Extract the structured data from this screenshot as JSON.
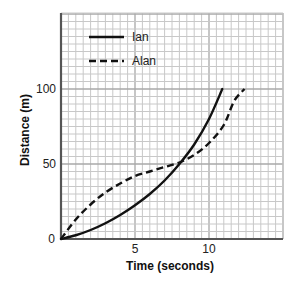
{
  "chart_data": {
    "type": "line",
    "title": "",
    "xlabel": "Time (seconds)",
    "ylabel": "Distance (m)",
    "xlim": [
      0,
      15
    ],
    "ylim": [
      0,
      150
    ],
    "x_ticks": [
      0,
      5,
      10
    ],
    "y_ticks": [
      50,
      100
    ],
    "origin_label": "0",
    "grid": true,
    "grid_minor": {
      "x_step": 0.5,
      "y_step": 5
    },
    "grid_major": {
      "x_step": 5,
      "y_step": 50
    },
    "legend_position": "upper-left-inside",
    "series": [
      {
        "name": "Ian",
        "style": "solid",
        "color": "#111111",
        "points": [
          [
            0,
            0
          ],
          [
            1,
            2.5
          ],
          [
            2,
            6
          ],
          [
            3,
            10.5
          ],
          [
            4,
            16
          ],
          [
            5,
            22.5
          ],
          [
            6,
            30
          ],
          [
            7,
            39
          ],
          [
            8,
            50
          ],
          [
            9,
            63
          ],
          [
            10,
            80
          ],
          [
            10.9,
            100
          ]
        ]
      },
      {
        "name": "Alan",
        "style": "dashed",
        "color": "#111111",
        "points": [
          [
            0,
            0
          ],
          [
            1,
            13
          ],
          [
            2,
            23
          ],
          [
            3,
            31
          ],
          [
            4,
            37
          ],
          [
            5,
            42
          ],
          [
            6,
            45
          ],
          [
            7,
            48
          ],
          [
            8,
            51
          ],
          [
            9,
            56
          ],
          [
            10,
            64
          ],
          [
            11,
            76
          ],
          [
            11.7,
            92
          ],
          [
            12.4,
            100
          ]
        ]
      }
    ]
  },
  "legend": {
    "items": [
      {
        "label": "Ian",
        "style": "solid"
      },
      {
        "label": "Alan",
        "style": "dashed"
      }
    ]
  },
  "axes": {
    "x_title": "Time (seconds)",
    "y_title": "Distance (m)",
    "x_tick_labels": [
      "0",
      "5",
      "10"
    ],
    "y_tick_labels": [
      "50",
      "100"
    ]
  },
  "colors": {
    "grid_minor": "#c8c8c8",
    "grid_major": "#a8a8a8",
    "axis": "#555555",
    "line": "#111111"
  }
}
